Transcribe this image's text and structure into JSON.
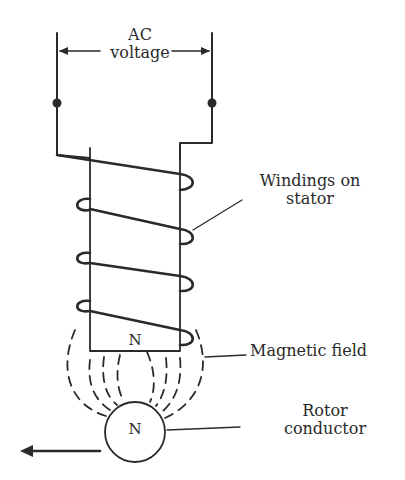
{
  "diagram": {
    "labels": {
      "ac_voltage": [
        "AC",
        "voltage"
      ],
      "windings": [
        "Windings on",
        "stator"
      ],
      "magnetic_field": "Magnetic field",
      "rotor": [
        "Rotor",
        "conductor"
      ],
      "stator_pole": "N",
      "rotor_pole": "N"
    },
    "components": {
      "terminals": 2,
      "winding_turns": 4,
      "field_lines": 8,
      "motion_arrow_direction": "left"
    },
    "colors": {
      "ink": "#2a2a2a",
      "background": "#ffffff"
    }
  }
}
